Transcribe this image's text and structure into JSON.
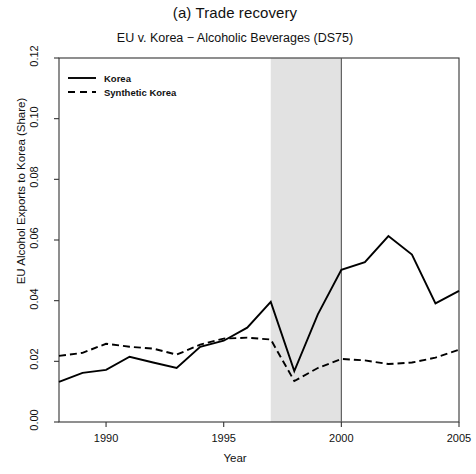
{
  "chart_data": {
    "type": "line",
    "title": "(a) Trade recovery",
    "subtitle": "EU v. Korea − Alcoholic Beverages (DS75)",
    "xlabel": "Year",
    "ylabel": "EU Alcohol Exports to Korea (Share)",
    "xlim": [
      1988,
      2005
    ],
    "ylim": [
      0.0,
      0.12
    ],
    "xticks": [
      1990,
      1995,
      2000,
      2005
    ],
    "xtick_labels": [
      "1990",
      "1995",
      "2000",
      "2005"
    ],
    "yticks": [
      0.0,
      0.02,
      0.04,
      0.06,
      0.08,
      0.1,
      0.12
    ],
    "ytick_labels": [
      "0.00",
      "0.02",
      "0.04",
      "0.06",
      "0.08",
      "0.10",
      "0.12"
    ],
    "grid": false,
    "legend_position": "top-left",
    "x": [
      1988,
      1989,
      1990,
      1991,
      1992,
      1993,
      1994,
      1995,
      1996,
      1997,
      1998,
      1999,
      2000,
      2001,
      2002,
      2003,
      2004,
      2005
    ],
    "series": [
      {
        "name": "Korea",
        "style": "solid",
        "color": "#000000",
        "values": [
          0.0132,
          0.0162,
          0.0172,
          0.0215,
          0.0196,
          0.0178,
          0.0248,
          0.0268,
          0.0311,
          0.0396,
          0.0168,
          0.0355,
          0.0502,
          0.0527,
          0.0613,
          0.0552,
          0.0391,
          0.0432
        ]
      },
      {
        "name": "Synthetic Korea",
        "style": "dashed",
        "color": "#000000",
        "values": [
          0.0218,
          0.0228,
          0.0258,
          0.0248,
          0.0242,
          0.0222,
          0.0255,
          0.0275,
          0.0278,
          0.0272,
          0.0135,
          0.0178,
          0.0208,
          0.0203,
          0.0191,
          0.0196,
          0.0212,
          0.0238
        ]
      }
    ],
    "shaded_region": {
      "name": "dispute-period-band",
      "x_start": 1997,
      "x_end": 2000,
      "color": "#e2e2e2"
    },
    "vertical_line": {
      "name": "intervention-line",
      "x": 2000,
      "color": "#555555"
    },
    "legend": [
      {
        "label": "Korea",
        "style": "solid"
      },
      {
        "label": "Synthetic Korea",
        "style": "dashed"
      }
    ]
  }
}
